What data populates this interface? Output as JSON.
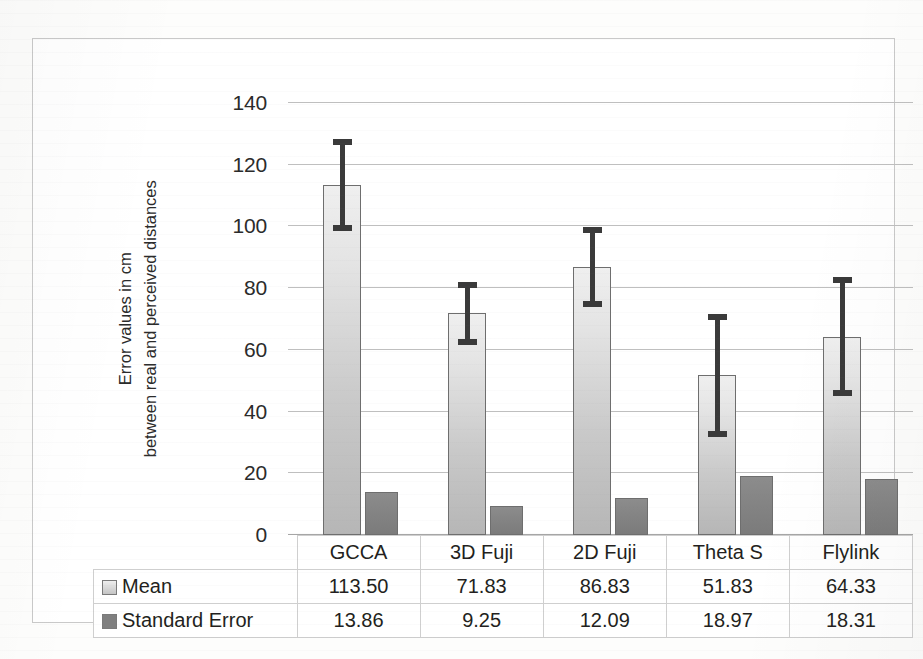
{
  "chart_data": {
    "type": "bar",
    "title": "",
    "xlabel": "",
    "ylabel": "Error values in cm between real and perceived distances",
    "ylabel_lines": [
      "Error values in cm",
      "between real and perceived distances"
    ],
    "categories": [
      "GCCA",
      "3D Fuji",
      "2D Fuji",
      "Theta S",
      "Flylink"
    ],
    "series": [
      {
        "name": "Mean",
        "values": [
          113.5,
          71.83,
          86.83,
          51.83,
          64.33
        ],
        "color": "#d0d0d0"
      },
      {
        "name": "Standard Error",
        "values": [
          13.86,
          9.25,
          12.09,
          18.97,
          18.31
        ],
        "color": "#808080"
      }
    ],
    "error_bars": {
      "applies_to": "Mean",
      "values": [
        13.86,
        9.25,
        12.09,
        18.97,
        18.31
      ],
      "color": "#3a3a3a"
    },
    "ylim": [
      0,
      140
    ],
    "yticks": [
      0,
      20,
      40,
      60,
      80,
      100,
      120,
      140
    ],
    "ytick_labels": [
      "0",
      "20",
      "40",
      "60",
      "80",
      "100",
      "120",
      "140"
    ],
    "grid": true,
    "grid_axis": "y",
    "legend_position": "table-below",
    "table": {
      "header": [
        "",
        "GCCA",
        "3D Fuji",
        "2D Fuji",
        "Theta S",
        "Flylink"
      ],
      "rows": [
        {
          "label": "Mean",
          "swatch": "mean-swatch-icon",
          "cells": [
            "113.50",
            "71.83",
            "86.83",
            "51.83",
            "64.33"
          ]
        },
        {
          "label": "Standard Error",
          "swatch": "standard-error-swatch-icon",
          "cells": [
            "13.86",
            "9.25",
            "12.09",
            "18.97",
            "18.31"
          ]
        }
      ]
    }
  }
}
